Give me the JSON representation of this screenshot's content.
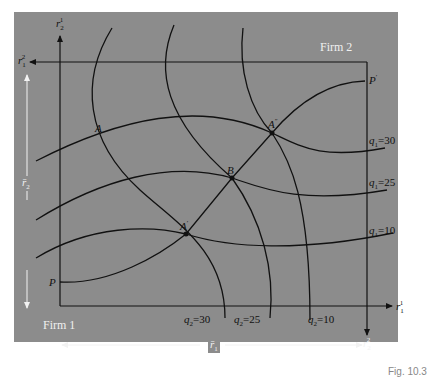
{
  "diagram": {
    "firm1_label": "Firm 1",
    "firm2_label": "Firm 2",
    "axes": {
      "firm1_x": "r1 superscript 1",
      "firm1_y": "r2 superscript 1",
      "firm2_x": "r1 superscript 2",
      "firm2_y": "r2 superscript 2",
      "total_x": "r̄1",
      "total_y": "r̄2"
    },
    "labels": {
      "r2_1_base": "r",
      "r2_1_sub": "2",
      "r2_1_sup": "1",
      "r1_2_base": "r",
      "r1_2_sub": "1",
      "r1_2_sup": "2",
      "r1_1_base": "r",
      "r1_1_sub": "1",
      "r1_1_sup": "1",
      "r2_2_base": "r",
      "r2_2_sub": "2",
      "r2_2_sup": "2",
      "rbar1": "r̄",
      "rbar1_sub": "1",
      "rbar2": "r̄",
      "rbar2_sub": "2"
    },
    "points": {
      "P": "P",
      "P_prime": "P",
      "P_prime_sup": "′",
      "A": "A",
      "A_prime": "A",
      "A_prime_sup": "′",
      "A_double_prime": "A",
      "A_double_prime_sup": "″",
      "B": "B"
    },
    "isoquants_firm1": [
      {
        "q": "q",
        "sub": "1",
        "eq": "=30"
      },
      {
        "q": "q",
        "sub": "1",
        "eq": "=25"
      },
      {
        "q": "q",
        "sub": "1",
        "eq": "=10"
      }
    ],
    "isoquants_firm2": [
      {
        "q": "q",
        "sub": "2",
        "eq": "=30"
      },
      {
        "q": "q",
        "sub": "2",
        "eq": "=25"
      },
      {
        "q": "q",
        "sub": "2",
        "eq": "=10"
      }
    ],
    "caption": "Fig. 10.3"
  },
  "colors": {
    "panel": "#8c8c8c",
    "lines": "#111111",
    "white_arrows": "#f2f2f2"
  }
}
